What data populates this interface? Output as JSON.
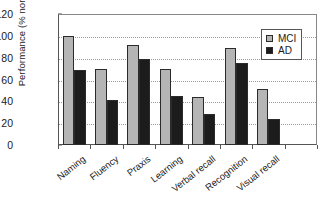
{
  "chart_data": {
    "type": "bar",
    "title": "",
    "xlabel": "",
    "ylabel": "Performance (% normal)",
    "ylim": [
      0,
      120
    ],
    "ytick_labels": [
      "0",
      "20",
      "40",
      "60",
      "80",
      "100",
      "120"
    ],
    "ytick_values": [
      0,
      20,
      40,
      60,
      80,
      100,
      120
    ],
    "grid": true,
    "legend_position": "top-right",
    "categories": [
      "Naming",
      "Fluency",
      "Praxis",
      "Learning",
      "Verbal recall",
      "Recognition",
      "Visual recall"
    ],
    "series": [
      {
        "name": "MCI",
        "color": "#b5b5b5",
        "values": [
          100,
          70,
          92,
          70,
          44,
          89,
          51
        ]
      },
      {
        "name": "AD",
        "color": "#1c1c1c",
        "values": [
          69,
          41,
          79,
          45,
          28,
          75,
          24
        ]
      }
    ]
  },
  "legend": {
    "entries": [
      {
        "label": "MCI",
        "swatch": "mci"
      },
      {
        "label": "AD",
        "swatch": "ad"
      }
    ]
  }
}
